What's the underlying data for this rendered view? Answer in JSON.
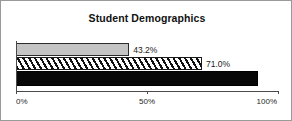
{
  "chart_data": {
    "type": "bar",
    "orientation": "horizontal",
    "title": "Student Demographics",
    "xlabel": "",
    "ylabel": "",
    "xlim": [
      0,
      100
    ],
    "grid": false,
    "legend": false,
    "categories": [
      "bar-1",
      "bar-2",
      "bar-3"
    ],
    "values": [
      43.2,
      71.0,
      92.5
    ],
    "data_labels": [
      "43.2%",
      "71.0%",
      "92.5%"
    ],
    "tick_labels": [
      "0%",
      "50%",
      "100%"
    ],
    "tick_values": [
      0,
      50,
      100
    ],
    "series": [
      {
        "name": "bar-1",
        "value": 43.2,
        "label": "43.2%",
        "fill": "solid-gray",
        "color": "#c4c4c4",
        "label_position": "outside"
      },
      {
        "name": "bar-2",
        "value": 71.0,
        "label": "71.0%",
        "fill": "diagonal-hatch",
        "color": "#ffffff",
        "label_position": "outside"
      },
      {
        "name": "bar-3",
        "value": 92.5,
        "label": "92.5%",
        "fill": "solid-black",
        "color": "#080808",
        "label_position": "inside"
      }
    ]
  },
  "frame": {
    "border_color": "#9a9a9a",
    "background": "#ffffff"
  }
}
